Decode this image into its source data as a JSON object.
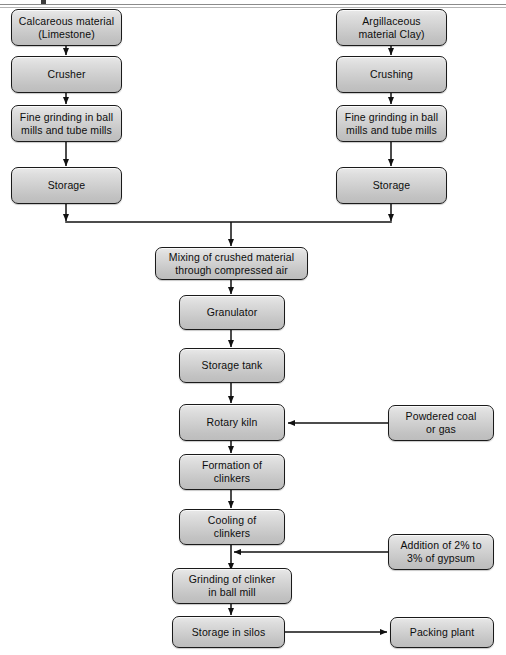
{
  "diagram": {
    "background_color": "#ffffff",
    "box_fill_top": "#e9e9e9",
    "box_fill_bottom": "#bdbdbd",
    "box_border_color": "#1a1a1a",
    "connector_color": "#111111"
  },
  "nodes": {
    "calcareous": "Calcareous material\n(Limestone)",
    "crusher": "Crusher",
    "fine_grinding_left": "Fine grinding in ball\nmills and tube mills",
    "storage_left": "Storage",
    "argillaceous": "Argillaceous\nmaterial  Clay)",
    "crushing": "Crushing",
    "fine_grinding_right": "Fine grinding in ball\nmills and tube mills",
    "storage_right": "Storage",
    "mixing": "Mixing of crushed material\nthrough compressed air",
    "granulator": "Granulator",
    "storage_tank": "Storage tank",
    "rotary_kiln": "Rotary kiln",
    "formation_clinkers": "Formation of\nclinkers",
    "cooling_clinkers": "Cooling of\nclinkers",
    "grinding_clinker": "Grinding of clinker\nin ball mill",
    "storage_silos": "Storage in silos",
    "powdered_coal": "Powdered coal\nor gas",
    "gypsum": "Addition of 2% to\n3% of gypsum",
    "packing_plant": "Packing plant"
  }
}
